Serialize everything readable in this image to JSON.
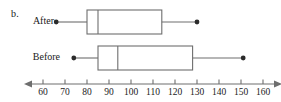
{
  "figure": {
    "part_letter": "b.",
    "colors": {
      "line": "#6e6e6e",
      "box_stroke": "#6e6e6e",
      "point": "#2b2b2b",
      "axis": "#6e6e6e",
      "text": "#1a1a1a",
      "background": "#ffffff"
    }
  },
  "chart_data": {
    "type": "box",
    "title": "",
    "xlabel": "",
    "ylabel": "",
    "xlim": [
      55,
      165
    ],
    "xticks": [
      60,
      70,
      80,
      90,
      100,
      110,
      120,
      130,
      140,
      150,
      160
    ],
    "xtick_labels": [
      "60",
      "70",
      "80",
      "90",
      "100",
      "110",
      "120",
      "130",
      "140",
      "150",
      "160"
    ],
    "grid": false,
    "legend": "none",
    "axis_arrows": [
      "left",
      "right"
    ],
    "orientation": "horizontal",
    "categories": [
      "After",
      "Before"
    ],
    "series": [
      {
        "name": "After",
        "min": 66,
        "q1": 80,
        "median": 85,
        "q3": 114,
        "max": 130
      },
      {
        "name": "Before",
        "min": 74,
        "q1": 85,
        "median": 94,
        "q3": 128,
        "max": 151
      }
    ]
  }
}
